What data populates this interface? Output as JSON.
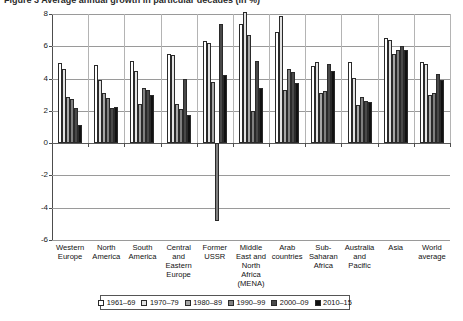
{
  "figure": {
    "caption_clipped": "Figure 3   Average annual growth in particular decades (in %)"
  },
  "chart_data": {
    "type": "bar",
    "title": "",
    "xlabel": "",
    "ylabel": "Average annual growth in particular decades (in %)",
    "ylim": [
      -6,
      8
    ],
    "yticks": [
      -6,
      -4,
      -2,
      0,
      2,
      4,
      6,
      8
    ],
    "ytick_labels": [
      "-6",
      "-4",
      "-2",
      "0",
      "2",
      "4",
      "6",
      "8"
    ],
    "grid": true,
    "legend_position": "bottom",
    "categories": [
      "Western Europe",
      "North America",
      "South America",
      "Central and Eastern Europe",
      "Former USSR",
      "Middle East and North Africa (MENA)",
      "Arab countries",
      "Sub-Saharan Africa",
      "Australia and Pacific",
      "Asia",
      "World average"
    ],
    "category_lines": [
      [
        "Western",
        "Europe"
      ],
      [
        "North",
        "America"
      ],
      [
        "South",
        "America"
      ],
      [
        "Central",
        "and",
        "Eastern",
        "Europe"
      ],
      [
        "Former",
        "USSR"
      ],
      [
        "Middle",
        "East and",
        "North",
        "Africa",
        "(MENA)"
      ],
      [
        "Arab",
        "countries"
      ],
      [
        "Sub-",
        "Saharan",
        "Africa"
      ],
      [
        "Australia",
        "and",
        "Pacific"
      ],
      [
        "Asia"
      ],
      [
        "World",
        "average"
      ]
    ],
    "series": [
      {
        "name": "1961–69",
        "color": "#ffffff",
        "values": [
          4.95,
          4.85,
          5.1,
          5.5,
          6.35,
          7.4,
          6.9,
          4.8,
          5.0,
          6.5,
          5.0
        ]
      },
      {
        "name": "1970–79",
        "color": "#e2e2e2",
        "values": [
          4.6,
          3.9,
          4.5,
          5.45,
          6.2,
          8.1,
          7.9,
          5.0,
          4.05,
          6.4,
          4.9
        ]
      },
      {
        "name": "1980–89",
        "color": "#a6a6a6",
        "values": [
          2.85,
          3.1,
          2.4,
          2.45,
          3.8,
          6.7,
          3.3,
          3.1,
          2.35,
          5.5,
          3.0
        ]
      },
      {
        "name": "1990–99",
        "color": "#808080",
        "values": [
          2.75,
          2.8,
          3.4,
          2.1,
          -4.8,
          2.0,
          4.6,
          3.2,
          2.85,
          5.8,
          3.1
        ]
      },
      {
        "name": "2000–09",
        "color": "#494949",
        "values": [
          2.2,
          2.15,
          3.3,
          3.95,
          7.4,
          5.1,
          4.4,
          4.9,
          2.6,
          6.0,
          4.3
        ]
      },
      {
        "name": "2010–15",
        "color": "#111111",
        "values": [
          1.15,
          2.25,
          3.0,
          1.75,
          4.25,
          3.4,
          3.7,
          4.5,
          2.55,
          5.8,
          3.9
        ]
      }
    ]
  }
}
